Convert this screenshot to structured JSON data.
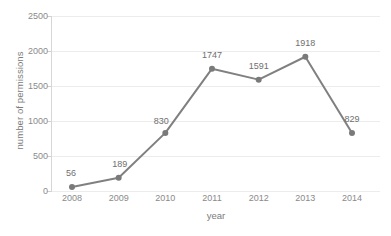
{
  "chart_data": {
    "type": "line",
    "title": "",
    "subtitle": "",
    "xlabel": "year",
    "ylabel": "number of permissions",
    "categories": [
      "2008",
      "2009",
      "2010",
      "2011",
      "2012",
      "2013",
      "2014"
    ],
    "values": [
      56,
      189,
      830,
      1747,
      1591,
      1918,
      829
    ],
    "data_labels": [
      "56",
      "189",
      "830",
      "1747",
      "1591",
      "1918",
      "829"
    ],
    "series": [
      {
        "name": "number of permissions",
        "values": [
          56,
          189,
          830,
          1747,
          1591,
          1918,
          829
        ]
      }
    ],
    "ylim": [
      0,
      2500
    ],
    "y_ticks": [
      0,
      500,
      1000,
      1500,
      2000,
      2500
    ],
    "y_tick_labels": [
      "0",
      "500",
      "1000",
      "1500",
      "2000",
      "2500"
    ],
    "grid": true,
    "grid_axis": "y",
    "legend": false,
    "legend_position": "none",
    "markers": true,
    "colors": {
      "line": "#808080",
      "marker": "#7a7a7a",
      "gridline": "#ececec",
      "axis": "#d6d6d6",
      "tick_text": "#8a8a8a",
      "label_text": "#6f6f6f",
      "title_text": "#7b7b7b",
      "background": "#ffffff"
    }
  }
}
